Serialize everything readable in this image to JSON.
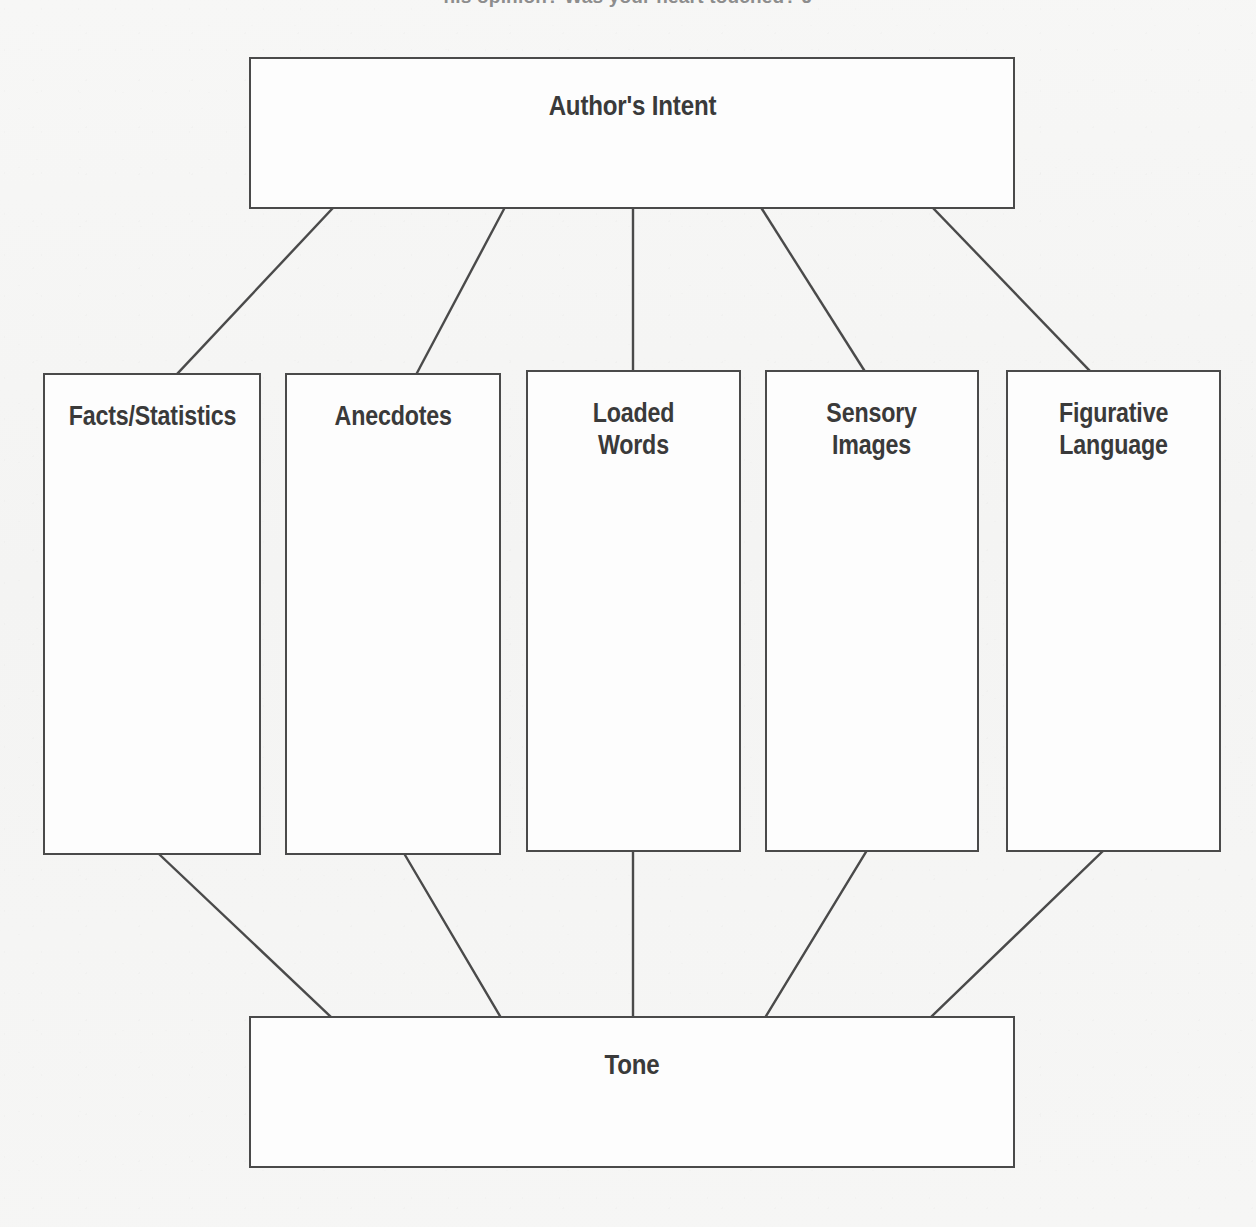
{
  "page": {
    "clipped_header_text": "his opinion? Was your heart touched? J"
  },
  "diagram": {
    "title": "Author's Intent",
    "top_node": {
      "id": "authors-intent",
      "label": "Author's Intent"
    },
    "bottom_node": {
      "id": "tone",
      "label": "Tone"
    },
    "middle_nodes": [
      {
        "id": "facts-statistics",
        "label": "Facts/Statistics"
      },
      {
        "id": "anecdotes",
        "label": "Anecdotes"
      },
      {
        "id": "loaded-words",
        "label": "Loaded\nWords"
      },
      {
        "id": "sensory-images",
        "label": "Sensory\nImages"
      },
      {
        "id": "figurative-language",
        "label": "Figurative\nLanguage"
      }
    ],
    "colors": {
      "stroke": "#4a4a4a",
      "text": "#3a3a3a",
      "box_fill": "#fdfdfd",
      "page_background": "#f6f6f5"
    }
  }
}
